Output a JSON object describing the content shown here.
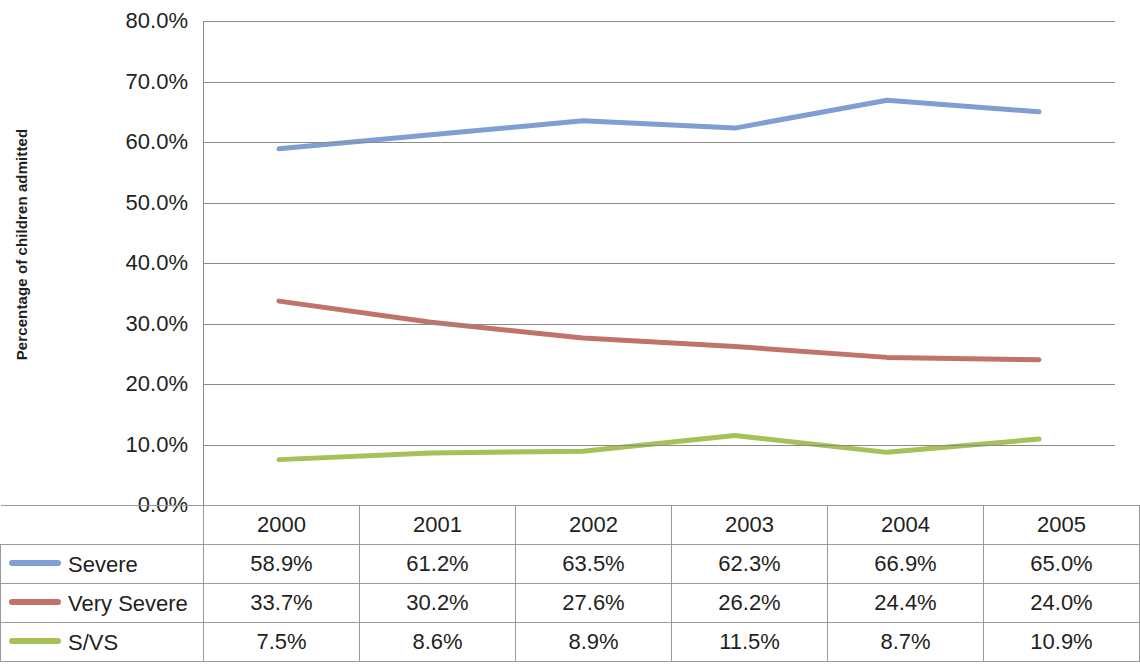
{
  "chart_data": {
    "type": "line",
    "title": "",
    "xlabel": "",
    "ylabel": "Percentage of children admitted",
    "categories": [
      "2000",
      "2001",
      "2002",
      "2003",
      "2004",
      "2005"
    ],
    "ylim": [
      0,
      80
    ],
    "ytick_labels": [
      "0.0%",
      "10.0%",
      "20.0%",
      "30.0%",
      "40.0%",
      "50.0%",
      "60.0%",
      "70.0%",
      "80.0%"
    ],
    "ytick_values": [
      0,
      10,
      20,
      30,
      40,
      50,
      60,
      70,
      80
    ],
    "grid": true,
    "legend_position": "data-table-left",
    "series": [
      {
        "name": "Severe",
        "color": "#7f9fd4",
        "values": [
          58.9,
          61.2,
          63.5,
          62.3,
          66.9,
          65.0
        ],
        "labels": [
          "58.9%",
          "61.2%",
          "63.5%",
          "62.3%",
          "66.9%",
          "65.0%"
        ]
      },
      {
        "name": "Very Severe",
        "color": "#c0736a",
        "values": [
          33.7,
          30.2,
          27.6,
          26.2,
          24.4,
          24.0
        ],
        "labels": [
          "33.7%",
          "30.2%",
          "27.6%",
          "26.2%",
          "24.4%",
          "24.0%"
        ]
      },
      {
        "name": "S/VS",
        "color": "#a5c158",
        "values": [
          7.5,
          8.6,
          8.9,
          11.5,
          8.7,
          10.9
        ],
        "labels": [
          "7.5%",
          "8.6%",
          "8.9%",
          "11.5%",
          "8.7%",
          "10.9%"
        ]
      }
    ]
  },
  "axis": {
    "y_title": "Percentage of children admitted"
  },
  "table": {
    "corner_label": "",
    "header": [
      "2000",
      "2001",
      "2002",
      "2003",
      "2004",
      "2005"
    ],
    "rows": [
      {
        "label": "Severe",
        "color": "#7f9fd4",
        "values": [
          "58.9%",
          "61.2%",
          "63.5%",
          "62.3%",
          "66.9%",
          "65.0%"
        ]
      },
      {
        "label": "Very Severe",
        "color": "#c0736a",
        "values": [
          "33.7%",
          "30.2%",
          "27.6%",
          "26.2%",
          "24.4%",
          "24.0%"
        ]
      },
      {
        "label": "S/VS",
        "color": "#a5c158",
        "values": [
          "7.5%",
          "8.6%",
          "8.9%",
          "11.5%",
          "8.7%",
          "10.9%"
        ]
      }
    ]
  }
}
